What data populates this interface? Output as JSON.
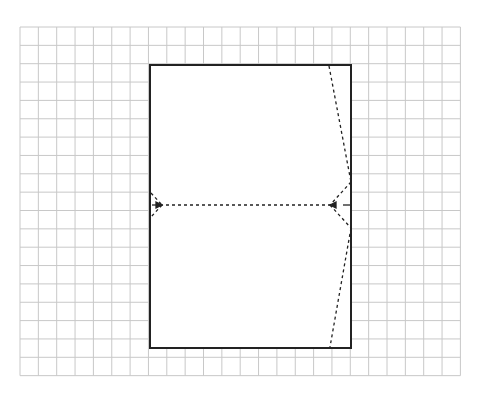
{
  "diagram": {
    "type": "folding-pattern",
    "grid": {
      "x0": 20,
      "y0": 27,
      "cols": 24,
      "rows": 19,
      "cell": 18.35,
      "color": "#c8c8c8"
    },
    "sheet": {
      "x": 150,
      "y": 65,
      "width": 201,
      "height": 283,
      "stroke": "#222222"
    },
    "fold_lines": [
      {
        "name": "top-right-diagonal",
        "points": [
          [
            329,
            66
          ],
          [
            351,
            182
          ]
        ]
      },
      {
        "name": "right-upper-chevron",
        "points": [
          [
            351,
            182
          ],
          [
            330,
            205
          ]
        ]
      },
      {
        "name": "right-lower-chevron",
        "points": [
          [
            330,
            205
          ],
          [
            351,
            228
          ]
        ]
      },
      {
        "name": "horizontal-center",
        "points": [
          [
            160,
            205
          ],
          [
            330,
            205
          ]
        ]
      },
      {
        "name": "bottom-right-diagonal",
        "points": [
          [
            351,
            228
          ],
          [
            330,
            347
          ]
        ]
      },
      {
        "name": "left-upper-chevron",
        "points": [
          [
            151,
            193
          ],
          [
            162,
            205
          ]
        ]
      },
      {
        "name": "left-lower-chevron",
        "points": [
          [
            162,
            205
          ],
          [
            151,
            217
          ]
        ]
      }
    ],
    "fold_color": "#222222"
  }
}
